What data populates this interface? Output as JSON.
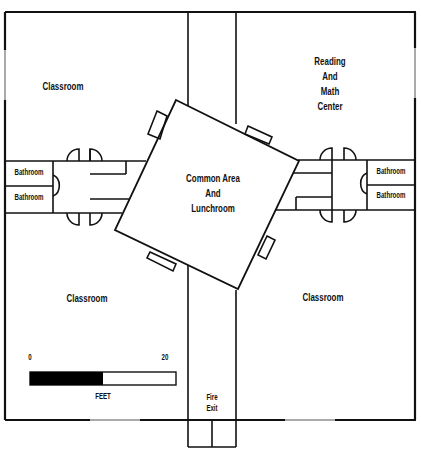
{
  "floor_plan": {
    "rooms": {
      "classroom_top_left": "Classroom",
      "reading_math_center": [
        "Reading",
        "And",
        "Math",
        "Center"
      ],
      "common_area": [
        "Common Area",
        "And",
        "Lunchroom"
      ],
      "classroom_bottom_left": "Classroom",
      "classroom_bottom_right": "Classroom",
      "bathroom_left_1": "Bathroom",
      "bathroom_left_2": "Bathroom",
      "bathroom_right_1": "Bathroom",
      "bathroom_right_2": "Bathroom",
      "fire_exit": [
        "Fire",
        "Exit"
      ]
    },
    "scale_bar": {
      "start_label": "0",
      "end_label": "20",
      "unit_label": "FEET",
      "fill_color": "#000000"
    },
    "colors": {
      "wall": "#111111",
      "window": "#aaaaaa",
      "background": "#ffffff"
    }
  }
}
